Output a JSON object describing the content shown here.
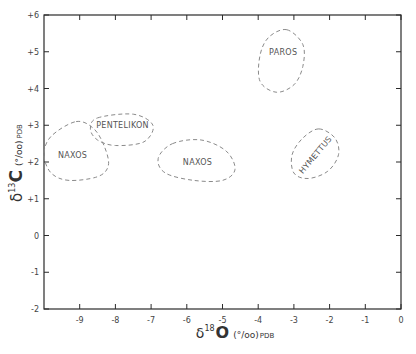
{
  "chart_data": {
    "type": "scatter",
    "title": "",
    "xlabel": "δ18O (‰) PDB",
    "ylabel": "δ13C (‰) PDB",
    "xlim": [
      -10,
      0
    ],
    "ylim": [
      -2,
      6
    ],
    "grid": false,
    "legend": "none",
    "x_ticks": [
      -9,
      -8,
      -7,
      -6,
      -5,
      -4,
      -3,
      -2,
      -1,
      0
    ],
    "x_tick_labels": [
      "-9",
      "-8",
      "-7",
      "-6",
      "-5",
      "-4",
      "-3",
      "-2",
      "-1",
      "0"
    ],
    "y_ticks": [
      6,
      5,
      4,
      3,
      2,
      1,
      0,
      -1,
      -2
    ],
    "y_tick_labels": [
      "+6",
      "+5",
      "+4",
      "+3",
      "+2",
      "+1",
      "0",
      "-1",
      "-2"
    ],
    "regions": [
      {
        "name": "NAXOS",
        "label": "NAXOS",
        "shape": "dashed-outline",
        "x_range": [
          -10.0,
          -8.1
        ],
        "y_range": [
          1.5,
          3.1
        ],
        "label_pos": [
          -9.2,
          2.2
        ],
        "label_rotation": 0,
        "path": [
          [
            -9.1,
            3.1
          ],
          [
            -8.6,
            2.9
          ],
          [
            -8.3,
            2.4
          ],
          [
            -8.2,
            1.9
          ],
          [
            -8.5,
            1.6
          ],
          [
            -9.3,
            1.5
          ],
          [
            -9.8,
            1.7
          ],
          [
            -10.0,
            2.2
          ],
          [
            -9.8,
            2.7
          ],
          [
            -9.1,
            3.1
          ]
        ]
      },
      {
        "name": "PENTELIKON",
        "label": "PENTELIKON",
        "shape": "dashed-outline",
        "x_range": [
          -8.7,
          -6.9
        ],
        "y_range": [
          2.4,
          3.3
        ],
        "label_pos": [
          -7.8,
          3.0
        ],
        "label_rotation": 0,
        "path": [
          [
            -8.5,
            3.2
          ],
          [
            -7.5,
            3.3
          ],
          [
            -6.95,
            3.0
          ],
          [
            -7.2,
            2.55
          ],
          [
            -8.0,
            2.45
          ],
          [
            -8.5,
            2.6
          ],
          [
            -8.7,
            2.9
          ],
          [
            -8.5,
            3.2
          ]
        ]
      },
      {
        "name": "NAXOS",
        "label": "NAXOS",
        "shape": "dashed-outline",
        "x_range": [
          -6.8,
          -4.6
        ],
        "y_range": [
          1.5,
          2.6
        ],
        "label_pos": [
          -5.7,
          2.0
        ],
        "label_rotation": 0,
        "path": [
          [
            -6.4,
            2.5
          ],
          [
            -5.6,
            2.6
          ],
          [
            -4.9,
            2.3
          ],
          [
            -4.65,
            1.8
          ],
          [
            -5.0,
            1.5
          ],
          [
            -5.8,
            1.5
          ],
          [
            -6.6,
            1.7
          ],
          [
            -6.8,
            2.1
          ],
          [
            -6.4,
            2.5
          ]
        ]
      },
      {
        "name": "PAROS",
        "label": "PAROS",
        "shape": "dashed-outline",
        "x_range": [
          -4.0,
          -2.7
        ],
        "y_range": [
          3.9,
          5.6
        ],
        "label_pos": [
          -3.3,
          5.0
        ],
        "label_rotation": 0,
        "path": [
          [
            -3.2,
            5.6
          ],
          [
            -2.75,
            5.2
          ],
          [
            -2.75,
            4.6
          ],
          [
            -3.0,
            4.1
          ],
          [
            -3.5,
            3.9
          ],
          [
            -3.95,
            4.2
          ],
          [
            -3.95,
            4.9
          ],
          [
            -3.7,
            5.4
          ],
          [
            -3.2,
            5.6
          ]
        ]
      },
      {
        "name": "HYMETTUS",
        "label": "HYMETTUS",
        "shape": "dashed-outline",
        "x_range": [
          -3.1,
          -1.7
        ],
        "y_range": [
          1.5,
          2.9
        ],
        "label_pos": [
          -2.4,
          2.2
        ],
        "label_rotation": -50,
        "path": [
          [
            -2.3,
            2.9
          ],
          [
            -1.85,
            2.65
          ],
          [
            -1.75,
            2.2
          ],
          [
            -2.05,
            1.75
          ],
          [
            -2.6,
            1.55
          ],
          [
            -3.0,
            1.7
          ],
          [
            -3.05,
            2.2
          ],
          [
            -2.75,
            2.65
          ],
          [
            -2.3,
            2.9
          ]
        ]
      }
    ]
  },
  "axes": {
    "y_title": {
      "delta": "δ",
      "isotope": "13",
      "element": "C",
      "units": "(°/oo)",
      "reference": "PDB"
    },
    "x_title": {
      "delta": "δ",
      "isotope": "18",
      "element": "O",
      "units": "(°/oo)",
      "reference": "PDB"
    }
  },
  "style": {
    "frame_color": "#2a2a2a",
    "outline_color": "#8a8a8a",
    "label_color": "#555555"
  }
}
